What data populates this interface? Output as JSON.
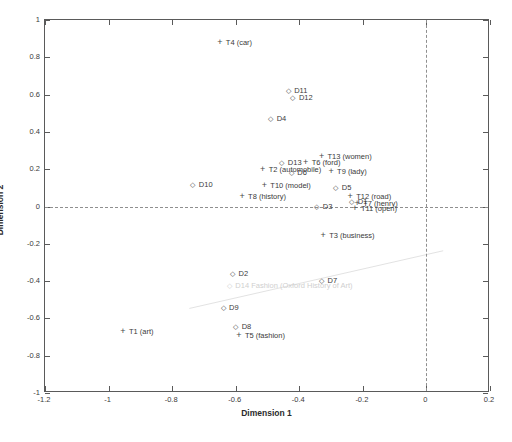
{
  "chart_data": {
    "type": "scatter",
    "title": "",
    "xlabel": "Dimension 1",
    "ylabel": "Dimension 2",
    "xlim": [
      -1.2,
      0.2
    ],
    "ylim": [
      -1.0,
      1.0
    ],
    "xticks": [
      "-1.2",
      "-1",
      "-0.8",
      "-0.6",
      "-0.4",
      "-0.2",
      "0",
      "0.2"
    ],
    "xtick_values": [
      -1.2,
      -1,
      -0.8,
      -0.6,
      -0.4,
      -0.2,
      0,
      0.2
    ],
    "yticks": [
      "1",
      "0.8",
      "0.6",
      "0.4",
      "0.2",
      "0",
      "-0.2",
      "-0.4",
      "-0.6",
      "-0.8",
      "-1"
    ],
    "ytick_values": [
      1,
      0.8,
      0.6,
      0.4,
      0.2,
      0,
      -0.2,
      -0.4,
      -0.6,
      -0.8,
      -1
    ],
    "grid": false,
    "legend": "none",
    "reference_lines": {
      "horizontal": 0,
      "vertical": 0,
      "style": "dashed"
    },
    "marker_styles": {
      "document": "diamond-outline",
      "term": "plus"
    },
    "series": [
      {
        "name": "Documents",
        "marker": "diamond",
        "points": [
          {
            "label": "D1",
            "text": "D1",
            "x": -0.235,
            "y": 0.03,
            "label_side": "left"
          },
          {
            "label": "D2",
            "text": "D2",
            "x": -0.61,
            "y": -0.355,
            "label_side": "right"
          },
          {
            "label": "D3",
            "text": "D3",
            "x": -0.345,
            "y": 0.005,
            "label_side": "right"
          },
          {
            "label": "D4",
            "text": "D4",
            "x": -0.49,
            "y": 0.475,
            "label_side": "right"
          },
          {
            "label": "D5",
            "text": "D5",
            "x": -0.285,
            "y": 0.105,
            "label_side": "right"
          },
          {
            "label": "D6",
            "text": "D6",
            "x": -0.425,
            "y": 0.185,
            "label_side": "right"
          },
          {
            "label": "D7",
            "text": "D7",
            "x": -0.33,
            "y": -0.395,
            "label_side": "right"
          },
          {
            "label": "D8",
            "text": "D8",
            "x": -0.6,
            "y": -0.64,
            "label_side": "right"
          },
          {
            "label": "D9",
            "text": "D9",
            "x": -0.64,
            "y": -0.54,
            "label_side": "right"
          },
          {
            "label": "D10",
            "text": "D10",
            "x": -0.735,
            "y": 0.12,
            "label_side": "right"
          },
          {
            "label": "D11",
            "text": "D11",
            "x": -0.435,
            "y": 0.625,
            "label_side": "right"
          },
          {
            "label": "D12",
            "text": "D12",
            "x": -0.42,
            "y": 0.585,
            "label_side": "right"
          },
          {
            "label": "D13",
            "text": "D13",
            "x": -0.455,
            "y": 0.24,
            "label_side": "right"
          },
          {
            "label": "D14",
            "text": "D14  Fashion (Oxford History of Art)",
            "x": -0.62,
            "y": -0.42,
            "label_side": "right",
            "faded": true
          }
        ]
      },
      {
        "name": "Terms",
        "marker": "plus",
        "points": [
          {
            "label": "T1",
            "text": "T1  (art)",
            "x": -0.955,
            "y": -0.665,
            "label_side": "right"
          },
          {
            "label": "T2",
            "text": "T2   (automobile)",
            "x": -0.515,
            "y": 0.2,
            "label_side": "right"
          },
          {
            "label": "T3",
            "text": "T3   (business)",
            "x": -0.325,
            "y": -0.155,
            "label_side": "right"
          },
          {
            "label": "T4",
            "text": "T4  (car)",
            "x": -0.65,
            "y": 0.88,
            "label_side": "right"
          },
          {
            "label": "T5",
            "text": "T5   (fashion)",
            "x": -0.59,
            "y": -0.69,
            "label_side": "right"
          },
          {
            "label": "T6",
            "text": "T6 (ford)",
            "x": -0.38,
            "y": 0.24,
            "label_side": "right"
          },
          {
            "label": "T7",
            "text": "T7   (henry)",
            "x": -0.218,
            "y": 0.02,
            "label_side": "right"
          },
          {
            "label": "T8",
            "text": "T8   (history)",
            "x": -0.58,
            "y": 0.055,
            "label_side": "right"
          },
          {
            "label": "T9",
            "text": "T9   (lady)",
            "x": -0.3,
            "y": 0.19,
            "label_side": "right"
          },
          {
            "label": "T10",
            "text": "T10   (model)",
            "x": -0.51,
            "y": 0.115,
            "label_side": "right"
          },
          {
            "label": "T11",
            "text": "T11 (open)",
            "x": -0.225,
            "y": -0.01,
            "label_side": "right"
          },
          {
            "label": "T12",
            "text": "T12 (road)",
            "x": -0.24,
            "y": 0.055,
            "label_side": "right"
          },
          {
            "label": "T13",
            "text": "T13 (women)",
            "x": -0.33,
            "y": 0.27,
            "label_side": "right"
          }
        ]
      }
    ]
  },
  "axes": {
    "x_title": "Dimension 1",
    "y_title": "Dimension 2"
  }
}
